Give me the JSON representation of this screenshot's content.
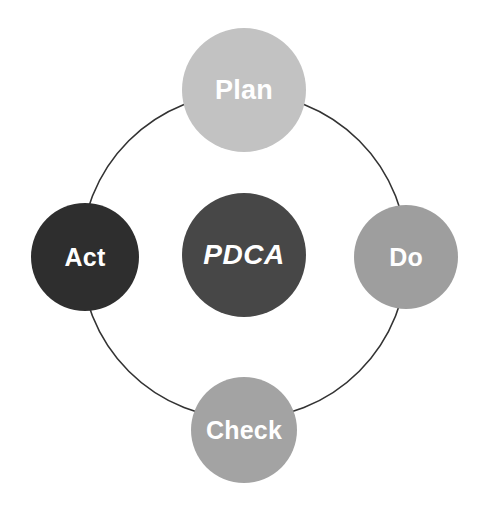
{
  "diagram": {
    "name": "PDCA Cycle",
    "center_label": "PDCA",
    "background_color": "#ffffff",
    "ring": {
      "name": "cycle-ring",
      "center_x": 244,
      "center_y": 256,
      "radius": 163,
      "stroke_color": "#333333",
      "stroke_width": 1.6,
      "fill": "none"
    },
    "nodes": [
      {
        "id": "plan",
        "label": "Plan",
        "position": "top",
        "center_x": 244,
        "center_y": 90,
        "radius": 62,
        "fill_color": "#c2c2c2",
        "text_color": "#ffffff",
        "font_style": "bold"
      },
      {
        "id": "do",
        "label": "Do",
        "position": "right",
        "center_x": 406,
        "center_y": 257,
        "radius": 52,
        "fill_color": "#9e9e9e",
        "text_color": "#ffffff",
        "font_style": "bold"
      },
      {
        "id": "check",
        "label": "Check",
        "position": "bottom",
        "center_x": 244,
        "center_y": 430,
        "radius": 53,
        "fill_color": "#a3a3a3",
        "text_color": "#ffffff",
        "font_style": "bold"
      },
      {
        "id": "act",
        "label": "Act",
        "position": "left",
        "center_x": 85,
        "center_y": 257,
        "radius": 54,
        "fill_color": "#2e2e2e",
        "text_color": "#ffffff",
        "font_style": "bold"
      },
      {
        "id": "pdca",
        "label": "PDCA",
        "position": "center",
        "center_x": 244,
        "center_y": 255,
        "radius": 62,
        "fill_color": "#474747",
        "text_color": "#ffffff",
        "font_style": "bold italic"
      }
    ]
  }
}
